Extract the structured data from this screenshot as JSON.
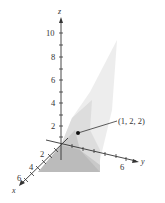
{
  "figure": {
    "type": "3d-surface-plot",
    "axes": {
      "z": {
        "label": "z",
        "ticks": [
          "2",
          "4",
          "6",
          "8",
          "10"
        ]
      },
      "x": {
        "label": "x",
        "ticks": [
          "2",
          "4",
          "6"
        ]
      },
      "y": {
        "label": "y",
        "ticks": [
          "6"
        ]
      }
    },
    "point": {
      "label": "(1, 2, 2)",
      "coords": [
        1,
        2,
        2
      ]
    },
    "colors": {
      "axis": "#333333",
      "surface_light": "#e6e6e6",
      "surface_mid": "#cfcfcf",
      "surface_dark": "#b5b5b5",
      "point": "#111111"
    }
  }
}
